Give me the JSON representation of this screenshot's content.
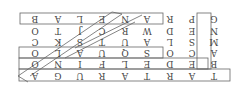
{
  "puzzle": {
    "title": "word search",
    "rotation_deg": 180,
    "grid": [
      [
        "T",
        "A",
        "R",
        "T",
        "A",
        "R",
        "U",
        "G",
        "A"
      ],
      [
        "B",
        "E",
        "D",
        "E",
        "L",
        "F",
        "I",
        "N",
        "O"
      ],
      [
        "A",
        "C",
        "O",
        "S",
        "Q",
        "U",
        "A",
        "L",
        "O"
      ],
      [
        "M",
        "S",
        "L",
        "A",
        "U",
        "T",
        "S",
        "K",
        "C"
      ],
      [
        "N",
        "E",
        "D",
        "W",
        "R",
        "C",
        "J",
        "T",
        "O"
      ],
      [
        "G",
        "P",
        "R",
        "A",
        "N",
        "E",
        "L",
        "A",
        "B"
      ]
    ],
    "found_words": [
      {
        "word": "TARTARUGA",
        "direction": "horizontal",
        "row": 0
      },
      {
        "word": "DELFINO",
        "direction": "horizontal",
        "row": 1
      },
      {
        "word": "SQUALO",
        "direction": "horizontal",
        "row": 2
      },
      {
        "word": "BALENA",
        "direction": "horizontal-reversed",
        "row": 5
      },
      {
        "word": "PESCE",
        "direction": "vertical",
        "col": 1
      },
      {
        "word": "ASTRO",
        "direction": "diagonal"
      },
      {
        "word": "AQUA",
        "direction": "diagonal"
      }
    ],
    "colors": {
      "letter": "#444444",
      "outline": "#666666",
      "background": "#ffffff"
    }
  }
}
